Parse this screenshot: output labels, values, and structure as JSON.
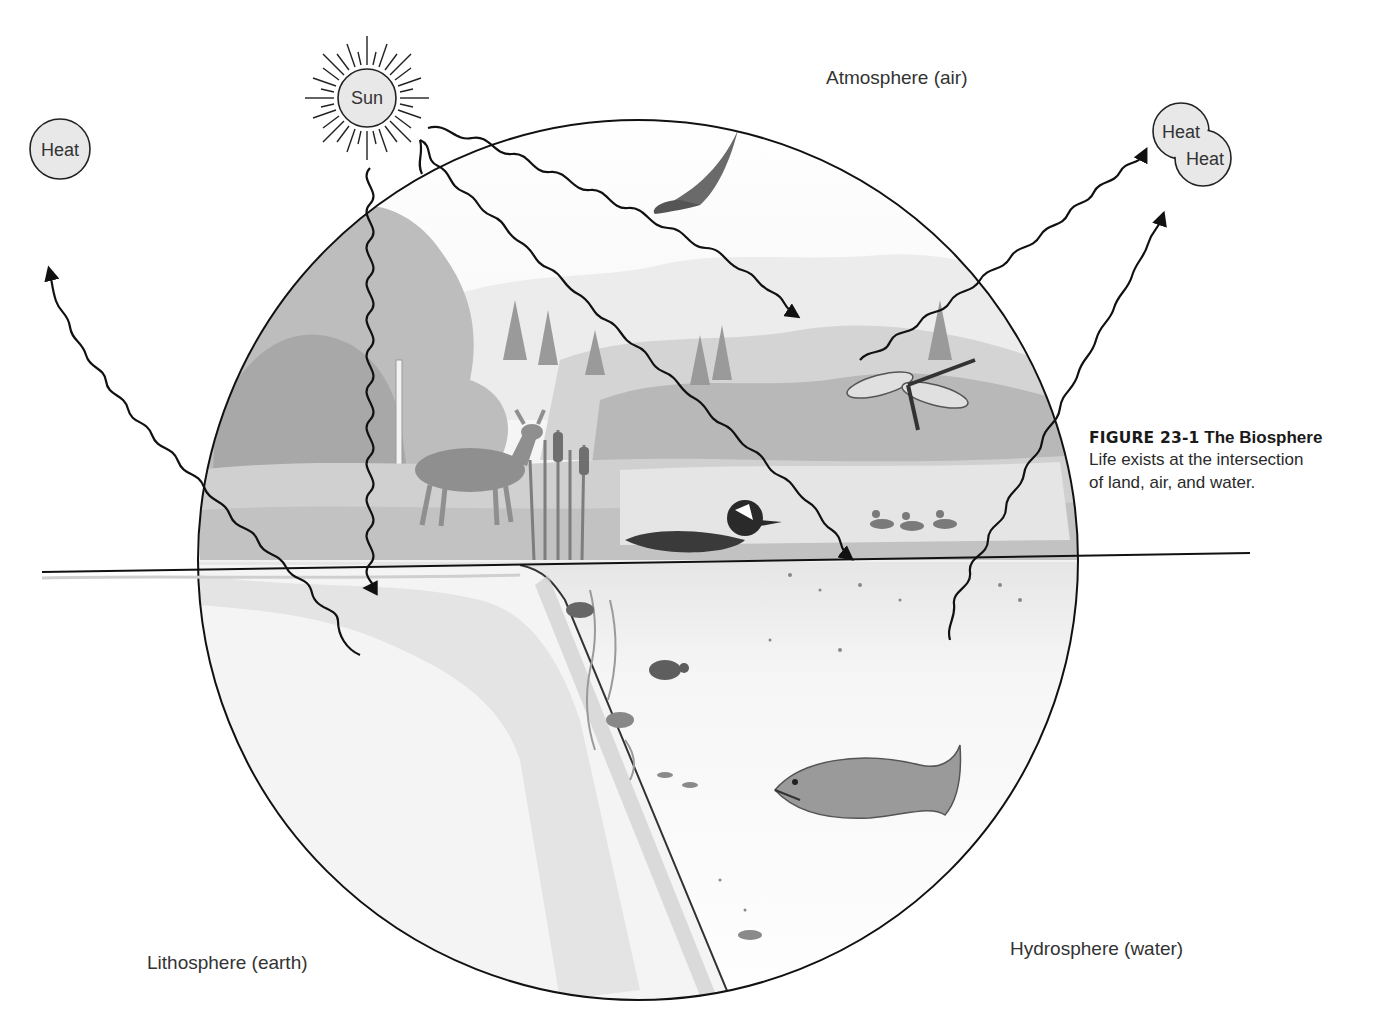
{
  "figure": {
    "number": "FIGURE 23-1",
    "title": "The Biosphere",
    "caption_lines": [
      "Life exists at the intersection",
      "of land, air, and water."
    ]
  },
  "regions": {
    "atmosphere": "Atmosphere (air)",
    "lithosphere": "Lithosphere (earth)",
    "hydrosphere": "Hydrosphere (water)"
  },
  "nodes": {
    "sun": "Sun",
    "heat_left": "Heat",
    "heat_right_1": "Heat",
    "heat_right_2": "Heat"
  },
  "scene_elements": [
    "eagle",
    "dragonfly",
    "deer",
    "cattails",
    "hooded-merganser",
    "ducks",
    "crayfish",
    "turtle",
    "trout",
    "small-fish",
    "trees",
    "mountains"
  ],
  "colors": {
    "line": "#111111",
    "bubble_fill": "#e8e8e8",
    "scene_gray_dark": "#8a8a8a",
    "scene_gray_mid": "#b5b5b5",
    "scene_gray_light": "#dcdcdc"
  }
}
